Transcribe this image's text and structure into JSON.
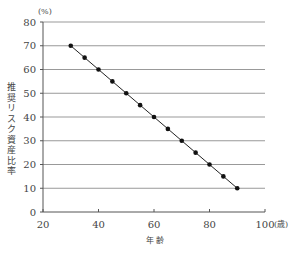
{
  "chart_data": {
    "type": "line",
    "title": "",
    "xlabel": "年 齢",
    "ylabel": "推奨リスク資産比率",
    "y_unit": "(%)",
    "x_unit": "(歳)",
    "x": [
      30,
      35,
      40,
      45,
      50,
      55,
      60,
      65,
      70,
      75,
      80,
      85,
      90
    ],
    "series": [
      {
        "name": "推奨リスク資産比率",
        "values": [
          70,
          65,
          60,
          55,
          50,
          45,
          40,
          35,
          30,
          25,
          20,
          15,
          10
        ]
      }
    ],
    "xlim": [
      20,
      100
    ],
    "ylim": [
      0,
      80
    ],
    "x_ticks": [
      20,
      40,
      60,
      80,
      100
    ],
    "y_ticks": [
      0,
      10,
      20,
      30,
      40,
      50,
      60,
      70,
      80
    ],
    "grid": "horizontal",
    "legend": "none",
    "colors": {
      "line": "#222222",
      "marker": "#111111",
      "grid": "#999999",
      "axis": "#555555"
    }
  }
}
